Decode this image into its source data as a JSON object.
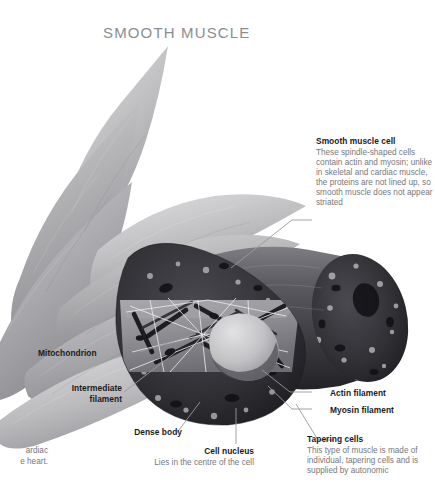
{
  "page": {
    "title": "SMOOTH MUSCLE",
    "background": "#ffffff",
    "title_color": "#8d8d8f",
    "heading_color": "#1b1b1b",
    "body_color": "#77777a",
    "leader_color": "#9a9a9d"
  },
  "callouts": {
    "smooth_muscle_cell": {
      "heading": "Smooth muscle cell",
      "body": "These spindle-shaped cells contain actin and myosin; unlike in skeletal and cardiac muscle, the proteins are not lined up, so smooth muscle does not appear striated"
    },
    "tapering_cells": {
      "heading": "Tapering cells",
      "body": "This type of muscle is made of individual, tapering cells and is supplied by autonomic"
    },
    "cell_nucleus": {
      "heading": "Cell nucleus",
      "body": "Lies in the centre of the cell"
    },
    "mitochondrion": {
      "heading": "Mitochondrion"
    },
    "intermediate_filament": {
      "heading": "Intermediate filament"
    },
    "dense_body": {
      "heading": "Dense body"
    },
    "actin_filament": {
      "heading": "Actin filament"
    },
    "myosin_filament": {
      "heading": "Myosin filament"
    },
    "cardiac_fragment": {
      "body": "ardiac\ne heart."
    }
  },
  "artwork": {
    "description": "Grayscale anatomical illustration of smooth muscle: bundled spindle-shaped cells tapering at both ends, with two large cylindrical cells in the foreground; the left cylinder is cut away to reveal internal structure including the cell nucleus, actin and myosin filaments, intermediate filaments, dense bodies and mitochondria.",
    "cell_light": "#b9b9bb",
    "cell_mid": "#9c9c9f",
    "cell_dark": "#7f7f83",
    "cut_dark": "#3a3a3e",
    "cut_darker": "#232327",
    "nucleus_light": "#c9c9cb",
    "interior_plane": "#8b8b8f"
  }
}
